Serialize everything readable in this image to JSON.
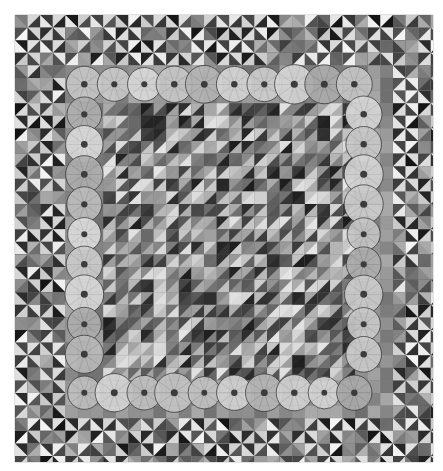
{
  "image": {
    "subject": "grayscale patchwork quilt",
    "background_color": "#ffffff",
    "quilt_bounds": {
      "x": 15,
      "y": 15,
      "width": 418,
      "height": 447
    },
    "regions": [
      {
        "name": "outer-border",
        "pattern": "pinwheel blocks of half-square triangles",
        "tones": [
          "#1e1e1e",
          "#f0f0f0",
          "#7a7a7a",
          "#a5a5a5"
        ]
      },
      {
        "name": "middle-border",
        "pattern": "large floral print (poppy-like flowers)",
        "tones": [
          "#b8b8b8",
          "#6d6d6d",
          "#dcdcdc"
        ]
      },
      {
        "name": "center-field",
        "pattern": "diagonal half-square triangles",
        "tones": [
          "#2a2a2a",
          "#d8d8d8",
          "#888888",
          "#5a5a5a"
        ]
      }
    ]
  }
}
